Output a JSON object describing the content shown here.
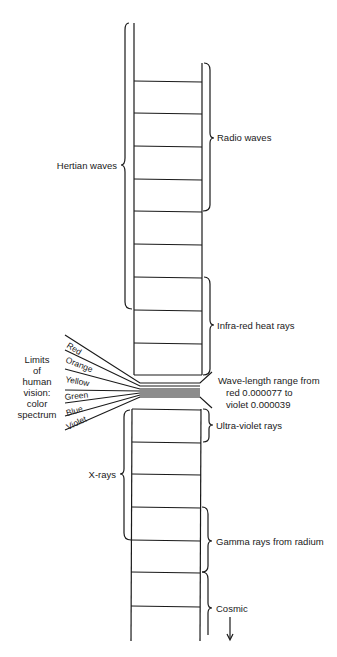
{
  "diagram": {
    "ink_color": "#1a1a1a",
    "background": "#ffffff",
    "labels": {
      "hertian": "Hertian waves",
      "radio": "Radio waves",
      "infrared": "Infra-red heat rays",
      "wavelength_line1": "Wave-length range from",
      "wavelength_line2": "red 0.000077 to",
      "wavelength_line3": "violet 0.000039",
      "ultraviolet": "Ultra-violet rays",
      "xrays": "X-rays",
      "gamma": "Gamma rays from radium",
      "cosmic": "Cosmic",
      "vision_line1": "Limits",
      "vision_line2": "of",
      "vision_line3": "human",
      "vision_line4": "vision:",
      "vision_line5": "color",
      "vision_line6": "spectrum"
    },
    "spectrum_colors": [
      "Red",
      "Orange",
      "Yellow",
      "Green",
      "Blue",
      "Violet"
    ],
    "upper_rungs_y": [
      81,
      113,
      146,
      179,
      211,
      244,
      277,
      310,
      343,
      375
    ],
    "lower_rungs_y": [
      409,
      442,
      474,
      507,
      540,
      572,
      606
    ],
    "direction_arrow": "down-arrow"
  }
}
